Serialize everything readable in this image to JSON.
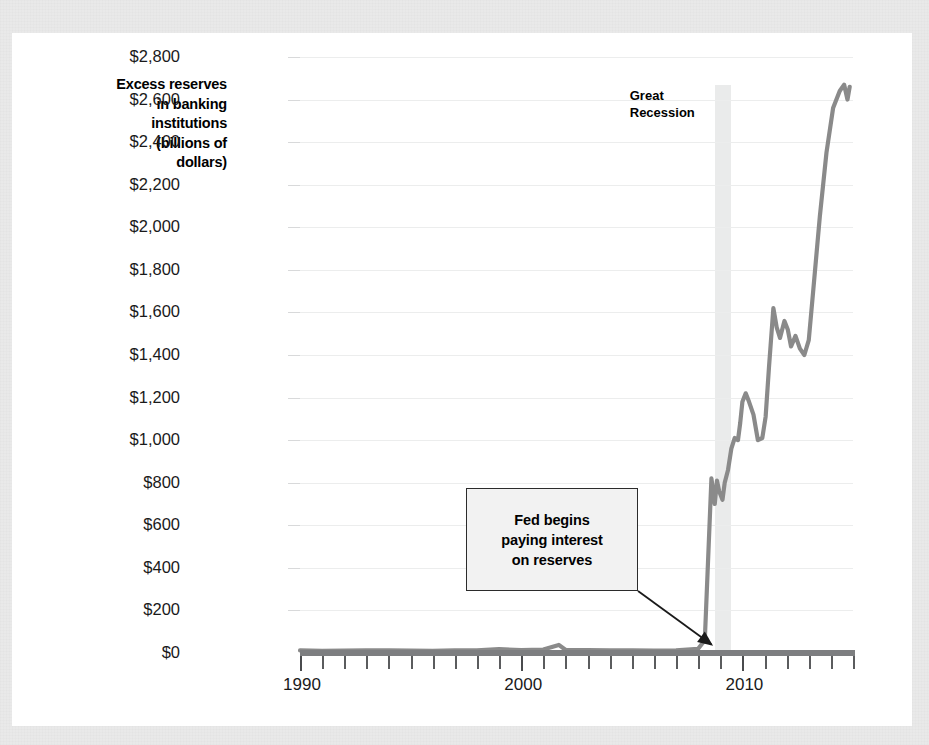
{
  "figure": {
    "background_color": "#e9e9e9",
    "card_color": "#ffffff",
    "line_color": "#8a8a8a",
    "band_color": "#e6e7e8",
    "grid_color": "#eceded"
  },
  "chart_data": {
    "type": "line",
    "title": "",
    "ylabel": "Excess reserves in banking institutions (billions of dollars)",
    "ylabel_lines": [
      "Excess reserves",
      "in banking",
      "institutions",
      "(billions of",
      "dollars)"
    ],
    "xlabel": "",
    "xlim": [
      1990,
      2015
    ],
    "ylim": [
      0,
      2800
    ],
    "grid": true,
    "legend": null,
    "y_ticks": [
      0,
      200,
      400,
      600,
      800,
      1000,
      1200,
      1400,
      1600,
      1800,
      2000,
      2200,
      2400,
      2600,
      2800
    ],
    "y_tick_labels": [
      "$0",
      "$200",
      "$400",
      "$600",
      "$800",
      "$1,000",
      "$1,200",
      "$1,400",
      "$1,600",
      "$1,800",
      "$2,000",
      "$2,200",
      "$2,400",
      "$2,600",
      "$2,800"
    ],
    "x_ticks_major": [
      1990,
      2000,
      2010
    ],
    "x_tick_labels": [
      "1990",
      "2000",
      "2010"
    ],
    "x_minor_tick_interval": 1,
    "series": [
      {
        "name": "Excess reserves",
        "x": [
          1990.0,
          1991.0,
          1992.0,
          1993.0,
          1994.0,
          1995.0,
          1996.0,
          1997.0,
          1998.0,
          1999.0,
          2000.0,
          2001.0,
          2001.7,
          2002.0,
          2003.0,
          2004.0,
          2005.0,
          2006.0,
          2007.0,
          2008.0,
          2008.3,
          2008.6,
          2008.75,
          2008.85,
          2008.95,
          2009.1,
          2009.2,
          2009.35,
          2009.5,
          2009.65,
          2009.8,
          2009.9,
          2010.0,
          2010.15,
          2010.3,
          2010.5,
          2010.7,
          2010.9,
          2011.05,
          2011.2,
          2011.4,
          2011.55,
          2011.7,
          2011.9,
          2012.05,
          2012.2,
          2012.4,
          2012.6,
          2012.8,
          2013.0,
          2013.2,
          2013.5,
          2013.8,
          2014.1,
          2014.4,
          2014.6,
          2014.75,
          2014.85
        ],
        "y": [
          12,
          10,
          11,
          13,
          12,
          11,
          10,
          12,
          13,
          18,
          14,
          16,
          38,
          15,
          14,
          13,
          12,
          11,
          13,
          20,
          60,
          820,
          700,
          810,
          760,
          720,
          800,
          860,
          960,
          1010,
          1000,
          1080,
          1180,
          1220,
          1180,
          1120,
          1000,
          1010,
          1110,
          1340,
          1620,
          1530,
          1480,
          1560,
          1520,
          1440,
          1490,
          1430,
          1400,
          1470,
          1700,
          2050,
          2350,
          2560,
          2640,
          2670,
          2600,
          2660
        ]
      }
    ],
    "shaded_regions": [
      {
        "label": "Great Recession",
        "x_start": 2008.75,
        "x_end": 2009.5,
        "color": "#e6e7e8"
      }
    ],
    "annotations": [
      {
        "text": "Fed begins paying interest on reserves",
        "text_lines": [
          "Fed begins",
          "paying interest",
          "on reserves"
        ],
        "pointer_x": 2008.6,
        "pointer_y": 40
      },
      {
        "text": "Great Recession",
        "text_lines": [
          "Great",
          "Recession"
        ]
      }
    ]
  }
}
